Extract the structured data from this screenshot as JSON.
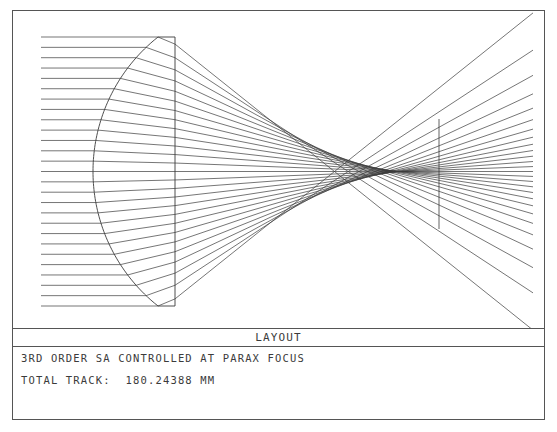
{
  "figure": {
    "title": "LAYOUT",
    "caption_line_1": "3RD ORDER SA CONTROLLED AT PARAX FOCUS",
    "caption_line_2": "TOTAL TRACK:  180.24388 MM",
    "total_track_label": "TOTAL TRACK:",
    "total_track_value": "180.24388",
    "total_track_units": "MM",
    "line_color": "#3b3b3b",
    "border_color": "#555555",
    "background_color": "#ffffff"
  },
  "chart_data": {
    "type": "line",
    "title": "LAYOUT",
    "subtitle": "3RD ORDER SA CONTROLLED AT PARAX FOCUS",
    "annotations": [
      "TOTAL TRACK:  180.24388 MM"
    ],
    "xlabel": "",
    "ylabel": "",
    "grid": false,
    "legend": null,
    "view_box": {
      "x": 0,
      "y": 0,
      "width": 531,
      "height": 317
    },
    "ray_count": 27,
    "ray_start_x": 28,
    "ray_top_y": 26,
    "ray_bottom_y": 295,
    "axis_y": 160.5,
    "lens": {
      "front_surface_vertex_x": 80,
      "front_surface_edge_x": 145,
      "front_surface_type": "convex-spherical",
      "rear_surface_x": 162,
      "rear_surface_type": "plano",
      "semi_aperture_top_y": 26,
      "semi_aperture_bottom_y": 295,
      "refractive_index": 1.62
    },
    "image_plane": {
      "x": 426,
      "top_y": 108,
      "bottom_y": 218,
      "label": "paraxial focus"
    },
    "fan_end_x": 520,
    "marginal_focus_x": 398,
    "paraxial_focus_x": 426,
    "series": [
      {
        "name": "collimated input rays",
        "description": "27 parallel rays entering from the left, equally spaced across the lens aperture"
      },
      {
        "name": "refracted rays",
        "description": "rays converging through the caustic, crossing near the paraxial focus and diverging to the right edge"
      }
    ]
  }
}
